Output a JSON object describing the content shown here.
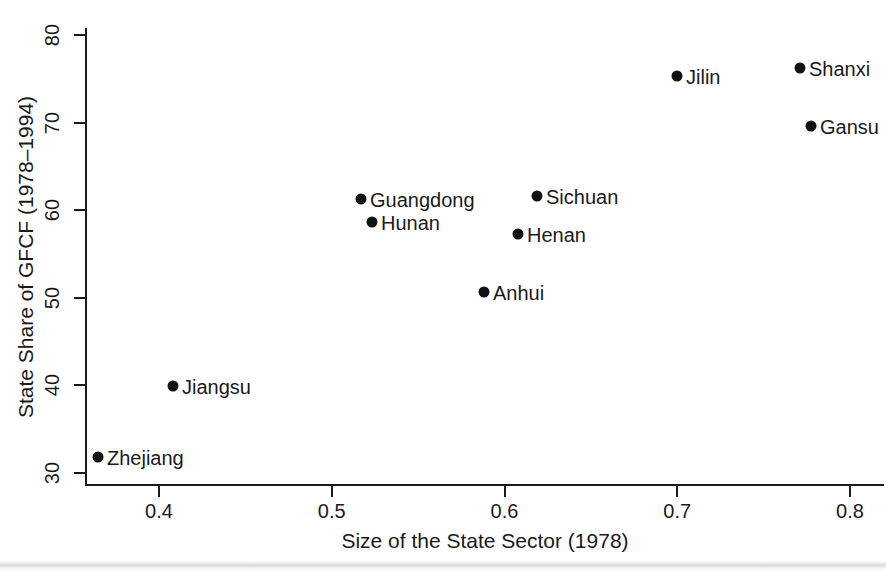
{
  "chart_data": {
    "type": "scatter",
    "title": "",
    "xlabel": "Size of the State Sector (1978)",
    "ylabel": "State Share of GFCF (1978–1994)",
    "xlim": [
      0.345,
      0.815
    ],
    "ylim": [
      29.0,
      80.6
    ],
    "xticks": [
      0.4,
      0.5,
      0.6,
      0.7,
      0.8
    ],
    "xtick_labels": [
      "0.4",
      "0.5",
      "0.6",
      "0.7",
      "0.8"
    ],
    "yticks": [
      30,
      40,
      50,
      60,
      70,
      80
    ],
    "ytick_labels": [
      "30",
      "40",
      "50",
      "60",
      "70",
      "80"
    ],
    "grid": false,
    "legend": "none",
    "marker": "filled-circle",
    "marker_color": "#111111",
    "points": [
      {
        "label": "Zhejiang",
        "x": 0.365,
        "y": 31.8,
        "px": 98,
        "py": 457,
        "label_side": "right"
      },
      {
        "label": "Jiangsu",
        "x": 0.408,
        "y": 39.9,
        "px": 173,
        "py": 386,
        "label_side": "right"
      },
      {
        "label": "Guangdong",
        "x": 0.517,
        "y": 61.3,
        "px": 361,
        "py": 199,
        "label_side": "right"
      },
      {
        "label": "Hunan",
        "x": 0.523,
        "y": 58.7,
        "px": 372,
        "py": 222,
        "label_side": "right"
      },
      {
        "label": "Anhui",
        "x": 0.588,
        "y": 50.7,
        "px": 484,
        "py": 292,
        "label_side": "right"
      },
      {
        "label": "Henan",
        "x": 0.608,
        "y": 57.3,
        "px": 518,
        "py": 234,
        "label_side": "right"
      },
      {
        "label": "Sichuan",
        "x": 0.619,
        "y": 61.7,
        "px": 537,
        "py": 196,
        "label_side": "right"
      },
      {
        "label": "Jilin",
        "x": 0.7,
        "y": 75.3,
        "px": 677,
        "py": 76,
        "label_side": "right"
      },
      {
        "label": "Shanxi",
        "x": 0.771,
        "y": 76.3,
        "px": 800,
        "py": 68,
        "label_side": "right"
      },
      {
        "label": "Gansu",
        "x": 0.777,
        "y": 69.6,
        "px": 811,
        "py": 126,
        "label_side": "right"
      }
    ]
  },
  "colors": {
    "background": "#ffffff",
    "axis": "#1a1a1a",
    "marker": "#111111",
    "text": "#1a1a1a"
  }
}
